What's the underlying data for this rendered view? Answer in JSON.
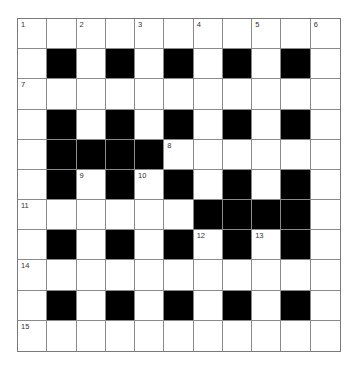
{
  "puzzle": {
    "rows": 11,
    "cols": 11,
    "colors": {
      "block": "#000000",
      "cell": "#ffffff",
      "gridline": "#8a8a8a"
    },
    "grid": [
      "WWWWWWWWWWW",
      "WBWBWBWBWBW",
      "WWWWWWWWWWW",
      "WBWBWBWBWBW",
      "WBBBBWWWWWW",
      "WBWBWBWBWBW",
      "WWWWWWBBBBW",
      "WBWBWBWBWBW",
      "WWWWWWWWWWW",
      "WBWBWBWBWBW",
      "WWWWWWWWWWW"
    ],
    "numbers": [
      {
        "row": 0,
        "col": 0,
        "n": "1"
      },
      {
        "row": 0,
        "col": 2,
        "n": "2"
      },
      {
        "row": 0,
        "col": 4,
        "n": "3"
      },
      {
        "row": 0,
        "col": 6,
        "n": "4"
      },
      {
        "row": 0,
        "col": 8,
        "n": "5"
      },
      {
        "row": 0,
        "col": 10,
        "n": "6"
      },
      {
        "row": 2,
        "col": 0,
        "n": "7"
      },
      {
        "row": 4,
        "col": 5,
        "n": "8"
      },
      {
        "row": 5,
        "col": 2,
        "n": "9"
      },
      {
        "row": 5,
        "col": 4,
        "n": "10"
      },
      {
        "row": 6,
        "col": 0,
        "n": "11"
      },
      {
        "row": 7,
        "col": 6,
        "n": "12"
      },
      {
        "row": 7,
        "col": 8,
        "n": "13"
      },
      {
        "row": 8,
        "col": 0,
        "n": "14"
      },
      {
        "row": 10,
        "col": 0,
        "n": "15"
      }
    ]
  }
}
